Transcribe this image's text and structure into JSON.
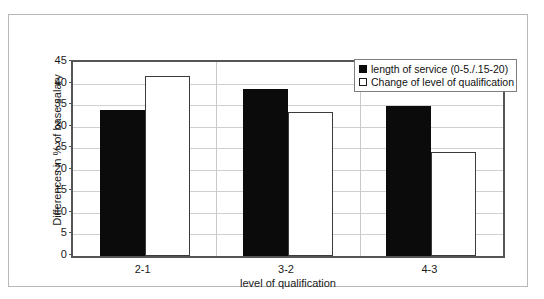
{
  "chart_data": {
    "type": "bar",
    "title": "",
    "subtitle": "",
    "xlabel": "level of qualification",
    "ylabel": "Differences in % of base salary",
    "categories": [
      "2-1",
      "3-2",
      "4-3"
    ],
    "series": [
      {
        "name": "length of service (0-5./.15-20)",
        "color": "#0b0b0b",
        "fill": "solid-black",
        "values": [
          33.8,
          38.7,
          34.8
        ]
      },
      {
        "name": "Change of level of qualification",
        "color": "#ffffff",
        "fill": "white-outlined",
        "values": [
          41.8,
          33.3,
          24.2
        ]
      }
    ],
    "ylim": [
      0,
      45
    ],
    "ytick_step": 5,
    "yticks": [
      "0",
      "5",
      "10",
      "15",
      "20",
      "25",
      "30",
      "35",
      "40",
      "45"
    ],
    "grid": "horizontal-and-category-separators",
    "legend_position": "top-right-inside"
  },
  "axes": {
    "y_title": "Differences in % of base salary",
    "x_title": "level of qualification"
  },
  "legend": {
    "items": [
      {
        "label": "length of service (0-5./.15-20)",
        "swatch": "filled-black-square"
      },
      {
        "label": "Change of level of qualification",
        "swatch": "empty-white-square"
      }
    ]
  },
  "colors": {
    "series_black": "#0b0b0b",
    "series_white": "#ffffff",
    "axis": "#555555",
    "grid": "#d0d0d0",
    "frame": "#b9b9b9",
    "text": "#1a1a1a"
  }
}
